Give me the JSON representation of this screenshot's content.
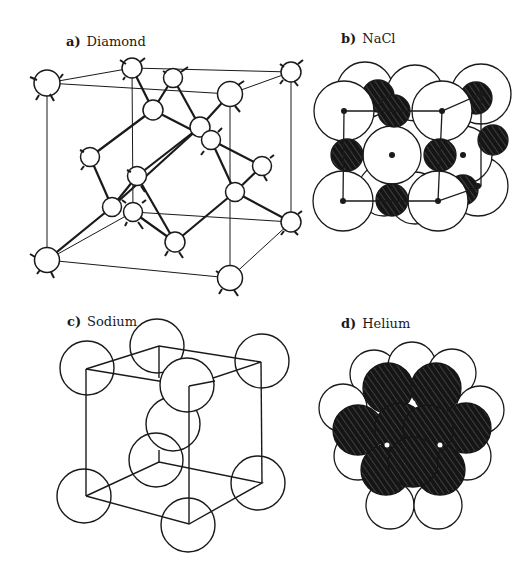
{
  "panels": {
    "a": {
      "letter": "a)",
      "title": "Diamond"
    },
    "b": {
      "letter": "b)",
      "title": "NaCl"
    },
    "c": {
      "letter": "c)",
      "title": "Sodium"
    },
    "d": {
      "letter": "d)",
      "title": "Helium"
    }
  },
  "colors": {
    "line": "#1a1a1a",
    "fill_light": "#ffffff",
    "fill_dark": "#151515",
    "hatch": "#9a9a9a"
  }
}
